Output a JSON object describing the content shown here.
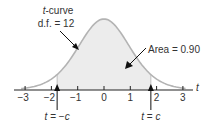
{
  "chart_data": {
    "type": "area",
    "title": "",
    "distribution": "t",
    "df": 12,
    "xlabel": "t",
    "ylabel": "",
    "xlim": [
      -3.4,
      3.4
    ],
    "x_ticks": [
      -3,
      -2,
      -1,
      0,
      1,
      2,
      3
    ],
    "x_tick_labels": [
      "−3",
      "−2",
      "−1",
      "0",
      "1",
      "2",
      "3"
    ],
    "shaded_region": {
      "from": -1.782,
      "to": 1.782,
      "area": 0.9
    },
    "grid": false,
    "legend": null
  },
  "labels": {
    "curve_name_italic": "t",
    "curve_name_rest": "-curve",
    "df_label": "d.f. = 12",
    "area_label": "Area = 0.90",
    "axis_label": "t",
    "left_marker_italic_t": "t",
    "left_marker_rest": " = −",
    "left_marker_c": "c",
    "right_marker_italic_t": "t",
    "right_marker_rest": " = ",
    "right_marker_c": "c"
  },
  "colors": {
    "curve_stroke": "#b3b3b3",
    "fill": "#ececec",
    "axis": "#222222",
    "text": "#333333",
    "arrow": "#111111"
  }
}
